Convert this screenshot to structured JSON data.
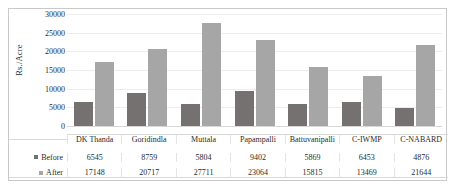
{
  "chart_data": {
    "type": "bar",
    "title": "",
    "xlabel": "",
    "ylabel": "Rs./Acre",
    "ylim": [
      0,
      30000
    ],
    "yticks": [
      "0",
      "5000",
      "10000",
      "15000",
      "20000",
      "25000",
      "30000"
    ],
    "grid": true,
    "legend_position": "table-row-labels",
    "categories": [
      "DK Thanda",
      "Goridindla",
      "Muttala",
      "Papampalli",
      "Battuvanipalli",
      "C-IWMP",
      "C-NABARD"
    ],
    "series": [
      {
        "name": "Before",
        "color": "#767171",
        "values": [
          6545,
          8759,
          5804,
          9402,
          5869,
          6453,
          4876
        ]
      },
      {
        "name": "After",
        "color": "#a6a6a6",
        "values": [
          17148,
          20717,
          27711,
          23064,
          15815,
          13469,
          21644
        ]
      }
    ]
  },
  "table": {
    "row_labels": [
      "Before",
      "After"
    ],
    "header_cells": [
      "DK Thanda",
      "Goridindla",
      "Muttala",
      "Papampalli",
      "Battuvanipalli",
      "C-IWMP",
      "C-NABARD"
    ],
    "rows": [
      [
        "6545",
        "8759",
        "5804",
        "9402",
        "5869",
        "6453",
        "4876"
      ],
      [
        "17148",
        "20717",
        "27711",
        "23064",
        "15815",
        "13469",
        "21644"
      ]
    ]
  },
  "colors": {
    "before": "#767171",
    "after": "#a6a6a6",
    "gridline": "#ededed",
    "border": "#c9c9c9",
    "text": "#2b2b2b"
  }
}
